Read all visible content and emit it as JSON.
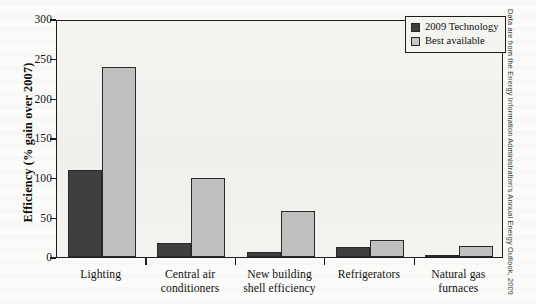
{
  "chart_data": {
    "type": "bar",
    "title": "",
    "xlabel": "",
    "ylabel": "Efficiency (% gain over 2007)",
    "ylim": [
      0,
      300
    ],
    "yticks": [
      0,
      50,
      100,
      150,
      200,
      250,
      300
    ],
    "ytick_labels": [
      "0",
      "50",
      "100",
      "150",
      "200",
      "250",
      "300"
    ],
    "grid": false,
    "legend_position": "top-right",
    "categories": [
      "Lighting",
      "Central air conditioners",
      "New building shell efficiency",
      "Refrigerators",
      "Natural gas furnaces"
    ],
    "category_lines": [
      [
        "Lighting"
      ],
      [
        "Central air",
        "conditioners"
      ],
      [
        "New building",
        "shell efficiency"
      ],
      [
        "Refrigerators"
      ],
      [
        "Natural gas",
        "furnaces"
      ]
    ],
    "series": [
      {
        "name": "2009 Technology",
        "color": "#3f3f3f",
        "values": [
          110,
          18,
          6,
          13,
          2
        ]
      },
      {
        "name": "Best available",
        "color": "#bfbfbf",
        "values": [
          240,
          99,
          58,
          22,
          14
        ]
      }
    ]
  },
  "legend": {
    "items": [
      {
        "label": "2009 Technology",
        "swatch": "dark"
      },
      {
        "label": "Best available",
        "swatch": "light"
      }
    ]
  },
  "source_note": "Data are from the Energy Information Administration's Annual Energy Outlook, 2009",
  "colors": {
    "dark_series": "#3f3f3f",
    "light_series": "#bfbfbf",
    "axis": "#1d1d1d",
    "plot_background": "#f2f2ef",
    "page_background": "#fbfbf9"
  }
}
